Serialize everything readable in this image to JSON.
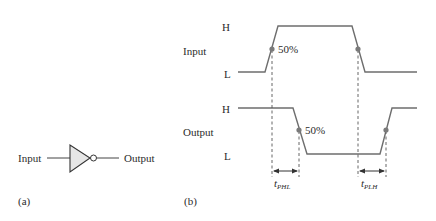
{
  "panel_a": {
    "label": "(a)",
    "input_label": "Input",
    "output_label": "Output",
    "gate": "inverter",
    "gate_fill": "#e6e6e6"
  },
  "panel_b": {
    "label": "(b)",
    "input_signal": {
      "name": "Input",
      "high_label": "H",
      "low_label": "L",
      "percent_label": "50%",
      "points": "238,72 265,72 278,26 352,26 365,72 417,72"
    },
    "output_signal": {
      "name": "Output",
      "high_label": "H",
      "low_label": "L",
      "percent_label": "50%",
      "points": "238,108 293,108 307,154 380,154 392,108 417,108"
    },
    "tphl": {
      "t": "t",
      "sub": "PHL"
    },
    "tplh": {
      "t": "t",
      "sub": "PLH"
    },
    "wave_color": "#6e6e6e",
    "dot_color": "#7a7a7a"
  }
}
